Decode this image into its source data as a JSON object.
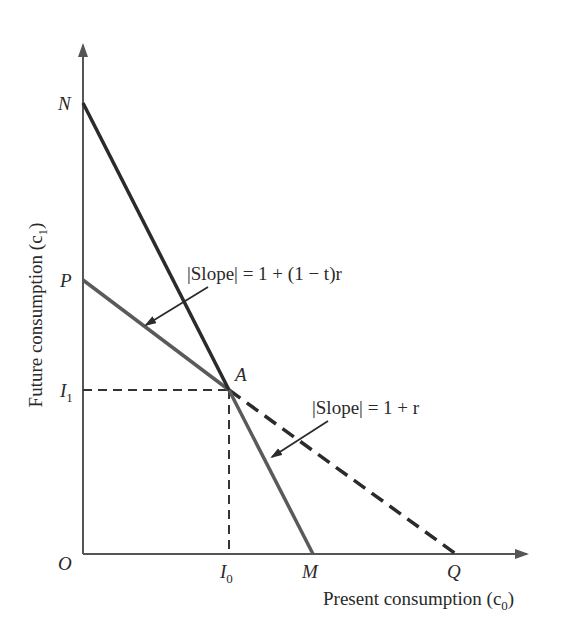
{
  "diagram": {
    "type": "intertemporal-budget-constraint",
    "colors": {
      "axis": "#555555",
      "line_NM": "#2b2b2b",
      "line_PA": "#5a5a5a",
      "dashed_AQ": "#2b2b2b",
      "guide": "#333333",
      "text": "#2a2a2a"
    },
    "axes": {
      "x_label": "Present consumption (c",
      "x_label_sub": "0",
      "x_label_close": ")",
      "y_label": "Future consumption (c",
      "y_label_sub": "1",
      "y_label_close": ")"
    },
    "points": {
      "origin": "O",
      "N": "N",
      "P": "P",
      "A": "A",
      "M": "M",
      "Q": "Q",
      "I1": "I",
      "I1_sub": "1",
      "I0": "I",
      "I0_sub": "0"
    },
    "annotations": {
      "slope_after_tax": "|Slope| = 1 + (1 − t)r",
      "slope_pre_tax": "|Slope| = 1 + r"
    },
    "lines": [
      {
        "name": "N-to-M",
        "from": "N",
        "to": "M",
        "style": "solid"
      },
      {
        "name": "P-to-A",
        "from": "P",
        "to": "A",
        "style": "solid"
      },
      {
        "name": "A-to-Q",
        "from": "A",
        "to": "Q",
        "style": "dashed"
      },
      {
        "name": "I1-guide",
        "from": "I1",
        "to": "A",
        "style": "dashed"
      },
      {
        "name": "I0-guide",
        "from": "A",
        "to": "I0",
        "style": "dashed"
      }
    ]
  }
}
